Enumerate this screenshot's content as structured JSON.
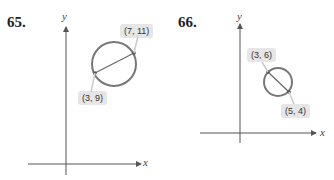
{
  "problems": [
    {
      "number": "65.",
      "axis_x_label": "x",
      "axis_y_label": "y",
      "endpoint_a": {
        "label": "(3, 9)",
        "x": 3,
        "y": 9
      },
      "endpoint_b": {
        "label": "(7, 11)",
        "x": 7,
        "y": 11
      }
    },
    {
      "number": "66.",
      "axis_x_label": "x",
      "axis_y_label": "y",
      "endpoint_a": {
        "label": "(3, 6)",
        "x": 3,
        "y": 6
      },
      "endpoint_b": {
        "label": "(5, 4)",
        "x": 5,
        "y": 4
      }
    }
  ],
  "colors": {
    "circle": "#777777",
    "axis": "#555555",
    "label_bg": "#e6e6e6"
  }
}
